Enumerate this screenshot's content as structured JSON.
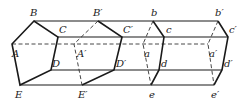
{
  "diagram": {
    "type": "prism-translation-figure",
    "labels": {
      "B": "B",
      "C": "C",
      "A": "A",
      "D": "D",
      "E": "E",
      "B1": "B′",
      "C1": "C′",
      "A1": "A′",
      "D1": "D′",
      "E1": "E′",
      "b": "b",
      "c": "c",
      "a": "a",
      "d": "d",
      "e": "e",
      "b1": "b′",
      "c1": "c′",
      "a1": "a′",
      "d1": "d′",
      "e1": "e′"
    }
  }
}
